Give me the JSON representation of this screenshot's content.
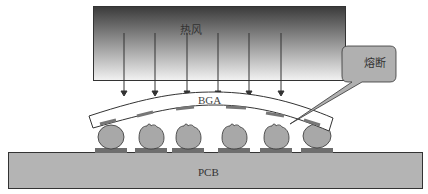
{
  "diagram": {
    "labels": {
      "hot_air": "热风",
      "bga": "BGA",
      "pcb": "PCB",
      "callout": "熔断"
    },
    "colors": {
      "heater_top": "#3a3a3a",
      "heater_bottom": "#f2f2f2",
      "pcb_fill": "#b4b4b4",
      "ball_fill": "#a8a8a8",
      "pad_fill": "#6e6e6e",
      "callout_fill": "#b0b0b0",
      "outline": "#333333"
    },
    "arrows_count": 6,
    "solder_balls_count": 6,
    "melted_balls_count": 4
  }
}
